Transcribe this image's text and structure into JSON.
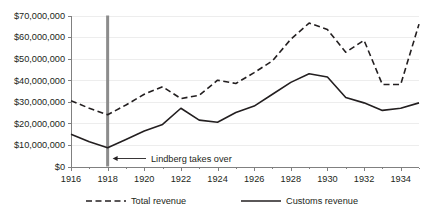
{
  "chart_data": {
    "type": "line",
    "title": "",
    "subtitle": "",
    "xlabel": "",
    "ylabel": "",
    "xlim": [
      1916,
      1935
    ],
    "ylim": [
      0,
      70000000
    ],
    "ytick_step": 10000000,
    "grid": true,
    "legend_position": "bottom",
    "x": [
      1916,
      1917,
      1918,
      1919,
      1920,
      1921,
      1922,
      1923,
      1924,
      1925,
      1926,
      1927,
      1928,
      1929,
      1930,
      1931,
      1932,
      1933,
      1934,
      1935
    ],
    "xtick_labels": [
      "1916",
      "1918",
      "1920",
      "1922",
      "1924",
      "1926",
      "1928",
      "1930",
      "1932",
      "1934"
    ],
    "xtick_values": [
      1916,
      1918,
      1920,
      1922,
      1924,
      1926,
      1928,
      1930,
      1932,
      1934
    ],
    "ytick_labels": [
      "$0",
      "$10,000,000",
      "$20,000,000",
      "$30,000,000",
      "$40,000,000",
      "$50,000,000",
      "$60,000,000",
      "$70,000,000"
    ],
    "ytick_values": [
      0,
      10000000,
      20000000,
      30000000,
      40000000,
      50000000,
      60000000,
      70000000
    ],
    "series": [
      {
        "name": "Total revenue",
        "style": "dashed",
        "color": "#231f20",
        "values": [
          30500000,
          27000000,
          24000000,
          28500000,
          33500000,
          37000000,
          31500000,
          33000000,
          40000000,
          38500000,
          43500000,
          49000000,
          59000000,
          66500000,
          63500000,
          53000000,
          58500000,
          38000000,
          38000000,
          66000000
        ]
      },
      {
        "name": "Customs revenue",
        "style": "solid",
        "color": "#231f20",
        "values": [
          15000000,
          11500000,
          8700000,
          12500000,
          16500000,
          19500000,
          27000000,
          21500000,
          20500000,
          25000000,
          28000000,
          33500000,
          39000000,
          43000000,
          41500000,
          32000000,
          29500000,
          26000000,
          27000000,
          29500000
        ]
      }
    ],
    "annotations": [
      {
        "label": "Lindberg takes over",
        "marker_x": 1918,
        "marker_type": "vertical-line",
        "marker_color": "#8c8c8c",
        "arrow": "left"
      }
    ],
    "legend": [
      {
        "label": "Total revenue",
        "style": "dashed"
      },
      {
        "label": "Customs revenue",
        "style": "solid"
      }
    ]
  }
}
